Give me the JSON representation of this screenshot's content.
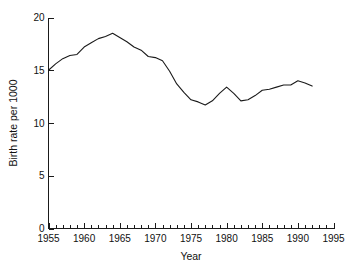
{
  "chart_data": {
    "type": "line",
    "title": "",
    "xlabel": "Year",
    "ylabel": "Birth rate per 1000",
    "xlim": [
      1955,
      1995
    ],
    "ylim": [
      0,
      20
    ],
    "grid": false,
    "legend": "none",
    "x_ticks_major": [
      1955,
      1960,
      1965,
      1970,
      1975,
      1980,
      1985,
      1990,
      1995
    ],
    "x_tick_labels": [
      "1955",
      "1960",
      "1965",
      "1970",
      "1975",
      "1980",
      "1985",
      "1990",
      "1995"
    ],
    "x_tick_minor_step": 1,
    "y_ticks_major": [
      0,
      5,
      10,
      15,
      20
    ],
    "y_tick_labels": [
      "0",
      "5",
      "10",
      "15",
      "20"
    ],
    "series": [
      {
        "name": "Birth rate per 1000",
        "color": "#1a1a1a",
        "x": [
          1955,
          1956,
          1957,
          1958,
          1959,
          1960,
          1961,
          1962,
          1963,
          1964,
          1965,
          1966,
          1967,
          1968,
          1969,
          1970,
          1971,
          1972,
          1973,
          1974,
          1975,
          1976,
          1977,
          1978,
          1979,
          1980,
          1981,
          1982,
          1983,
          1984,
          1985,
          1986,
          1987,
          1988,
          1989,
          1990,
          1991,
          1992
        ],
        "values": [
          15.0,
          15.6,
          16.1,
          16.4,
          16.5,
          17.2,
          17.6,
          18.0,
          18.2,
          18.5,
          18.1,
          17.7,
          17.2,
          16.9,
          16.3,
          16.2,
          15.9,
          14.9,
          13.7,
          12.9,
          12.2,
          12.0,
          11.7,
          12.1,
          12.8,
          13.4,
          12.8,
          12.1,
          12.2,
          12.6,
          13.1,
          13.2,
          13.4,
          13.6,
          13.6,
          14.0,
          13.8,
          13.5
        ]
      }
    ],
    "annotations": []
  },
  "axis": {
    "x_title": "Year",
    "y_title": "Birth rate per 1000"
  }
}
